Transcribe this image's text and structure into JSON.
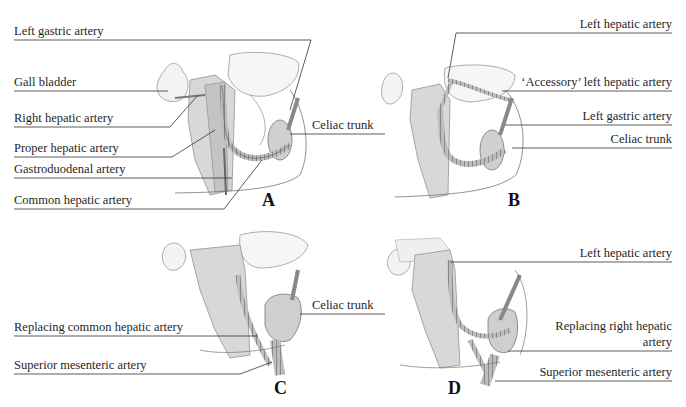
{
  "figure": {
    "panels": [
      {
        "letter": "A",
        "labels": [
          "Left gastric artery",
          "Gall bladder",
          "Right hepatic artery",
          "Proper hepatic artery",
          "Gastroduodenal artery",
          "Common hepatic artery",
          "Celiac trunk"
        ]
      },
      {
        "letter": "B",
        "labels": [
          "Left hepatic artery",
          "‘Accessory’ left hepatic artery",
          "Left gastric artery",
          "Celiac trunk"
        ]
      },
      {
        "letter": "C",
        "labels": [
          "Replacing common hepatic artery",
          "Superior mesenteric artery",
          "Celiac trunk"
        ]
      },
      {
        "letter": "D",
        "labels": [
          "Left hepatic artery",
          "Replacing right hepatic",
          "artery",
          "Superior mesenteric artery"
        ]
      }
    ]
  },
  "colors": {
    "line": "#333333",
    "organ_fill": "#f2f2f2",
    "organ_stroke": "#9a9a9a",
    "vessel_fill": "#b8b8b8",
    "vessel_stroke": "#555555",
    "tissue_fill": "#c9c9c9"
  }
}
